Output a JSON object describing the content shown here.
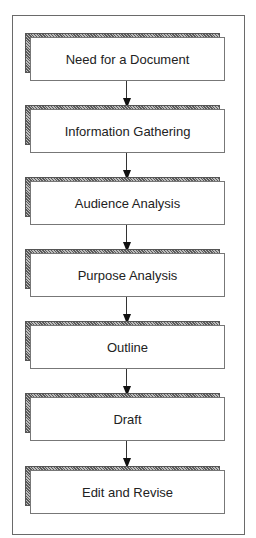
{
  "diagram": {
    "type": "flowchart",
    "direction": "top-to-bottom",
    "steps": [
      {
        "label": "Need for a Document"
      },
      {
        "label": "Information Gathering"
      },
      {
        "label": "Audience Analysis"
      },
      {
        "label": "Purpose Analysis"
      },
      {
        "label": "Outline"
      },
      {
        "label": "Draft"
      },
      {
        "label": "Edit and Revise"
      }
    ],
    "colors": {
      "border": "#777777",
      "shadow": "#8a8a8a",
      "arrow": "#111111"
    }
  }
}
